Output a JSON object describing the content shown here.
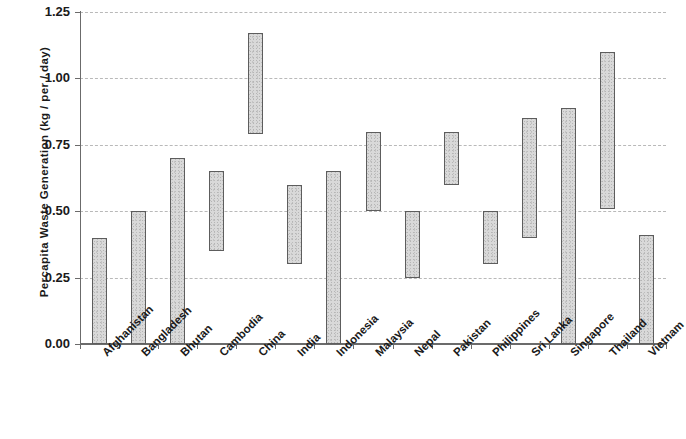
{
  "chart_data": {
    "type": "bar",
    "title": "",
    "subtitle": "",
    "xlabel": "",
    "ylabel": "Percapita Waste Generation (kg / per / day)",
    "ylim": [
      0.0,
      1.25
    ],
    "ytick_labels": [
      "1.25",
      "1.00",
      "0.75",
      "0.50",
      "0.25",
      "0.00"
    ],
    "ytick_values": [
      1.25,
      1.0,
      0.75,
      0.5,
      0.25,
      0.0
    ],
    "grid": "horizontal dashed gridlines at each y tick",
    "legend": "none",
    "orientation": "vertical",
    "bar_style": "floating range bars (low to high), light gray speckled fill with dark outline",
    "categories": [
      "Afghanistan",
      "Bangladesh",
      "Bhutan",
      "Cambodia",
      "China",
      "India",
      "Indonesia",
      "Malaysia",
      "Nepal",
      "Pakistan",
      "Philippines",
      "Sri Lanka",
      "Singapore",
      "Thailand",
      "Vietnam"
    ],
    "series": [
      {
        "name": "low",
        "values": [
          0.0,
          0.0,
          0.0,
          0.35,
          0.79,
          0.3,
          0.0,
          0.5,
          0.25,
          0.6,
          0.3,
          0.4,
          0.0,
          0.51,
          0.0
        ]
      },
      {
        "name": "high",
        "values": [
          0.4,
          0.5,
          0.7,
          0.65,
          1.17,
          0.6,
          0.65,
          0.8,
          0.5,
          0.8,
          0.5,
          0.85,
          0.89,
          1.1,
          0.41
        ]
      }
    ],
    "points": [
      {
        "category": "Afghanistan",
        "low": 0.0,
        "high": 0.4
      },
      {
        "category": "Bangladesh",
        "low": 0.0,
        "high": 0.5
      },
      {
        "category": "Bhutan",
        "low": 0.0,
        "high": 0.7
      },
      {
        "category": "Cambodia",
        "low": 0.35,
        "high": 0.65
      },
      {
        "category": "China",
        "low": 0.79,
        "high": 1.17
      },
      {
        "category": "India",
        "low": 0.3,
        "high": 0.6
      },
      {
        "category": "Indonesia",
        "low": 0.0,
        "high": 0.65
      },
      {
        "category": "Malaysia",
        "low": 0.5,
        "high": 0.8
      },
      {
        "category": "Nepal",
        "low": 0.25,
        "high": 0.5
      },
      {
        "category": "Pakistan",
        "low": 0.6,
        "high": 0.8
      },
      {
        "category": "Philippines",
        "low": 0.3,
        "high": 0.5
      },
      {
        "category": "Sri Lanka",
        "low": 0.4,
        "high": 0.85
      },
      {
        "category": "Singapore",
        "low": 0.0,
        "high": 0.89
      },
      {
        "category": "Thailand",
        "low": 0.51,
        "high": 1.1
      },
      {
        "category": "Vietnam",
        "low": 0.0,
        "high": 0.41
      }
    ],
    "colors": {
      "bar_fill": "#d9d9d9",
      "bar_outline": "#5d5d5d",
      "gridline": "#b9b9b9",
      "axis": "#6b6b6b",
      "text": "#1a1a1a",
      "background": "#ffffff"
    }
  }
}
